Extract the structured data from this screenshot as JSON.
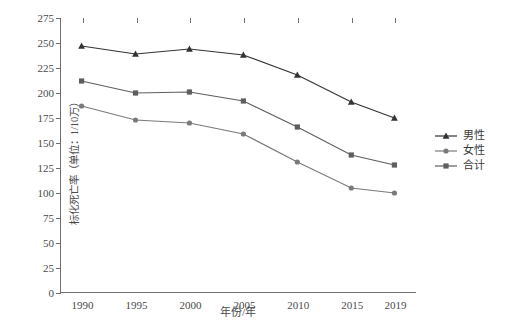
{
  "chart_data": {
    "type": "line",
    "title": "",
    "xlabel": "年份/年",
    "ylabel": "标化死亡率（单位：1/10万）",
    "categories": [
      "1990",
      "1995",
      "2000",
      "2005",
      "2010",
      "2015",
      "2019"
    ],
    "x": [
      1990,
      1995,
      2000,
      2005,
      2010,
      2015,
      2019
    ],
    "xlim": [
      1988,
      2021
    ],
    "ylim": [
      0,
      275
    ],
    "yticks": [
      0,
      25,
      50,
      75,
      100,
      125,
      150,
      175,
      200,
      225,
      250,
      275
    ],
    "grid": false,
    "legend_position": "right",
    "series": [
      {
        "name": "男性",
        "marker": "triangle",
        "color": "#333333",
        "values": [
          247,
          239,
          244,
          238,
          218,
          191,
          175
        ]
      },
      {
        "name": "女性",
        "marker": "circle",
        "color": "#7a7a7a",
        "values": [
          187,
          173,
          170,
          159,
          131,
          105,
          100
        ]
      },
      {
        "name": "合计",
        "marker": "square",
        "color": "#5e5e5e",
        "values": [
          212,
          200,
          201,
          192,
          166,
          138,
          128
        ]
      }
    ]
  },
  "axes": {
    "y_title": "标化死亡率（单位：1/10万）",
    "x_title": "年份/年",
    "y_tick_labels": [
      "275",
      "250",
      "225",
      "200",
      "175",
      "150",
      "125",
      "100",
      "75",
      "50",
      "25",
      "0"
    ],
    "x_tick_labels": [
      "1990",
      "1995",
      "2000",
      "2005",
      "2010",
      "2015",
      "2019"
    ]
  },
  "legend": {
    "items": [
      {
        "label": "男性",
        "marker": "triangle",
        "color": "#333333"
      },
      {
        "label": "女性",
        "marker": "circle",
        "color": "#7a7a7a"
      },
      {
        "label": "合计",
        "marker": "square",
        "color": "#5e5e5e"
      }
    ]
  },
  "colors": {
    "axis": "#6f6f6f",
    "text": "#4a4a4a",
    "background": "#ffffff"
  }
}
